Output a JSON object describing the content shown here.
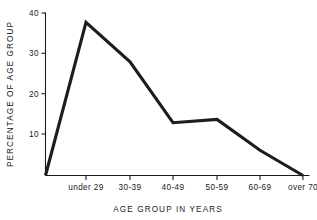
{
  "chart_data": {
    "type": "line",
    "title": "",
    "xlabel": "AGE GROUP IN YEARS",
    "ylabel": "PERCENTAGE OF AGE GROUP",
    "categories": [
      "under 29",
      "30-39",
      "40-49",
      "50-59",
      "60-69",
      "over 70"
    ],
    "values": [
      37.7,
      28.0,
      13.0,
      13.8,
      6.2,
      0.0
    ],
    "series": [
      {
        "name": "Percentage of age group",
        "values": [
          37.7,
          28.0,
          13.0,
          13.8,
          6.2,
          0.0
        ]
      }
    ],
    "leading_origin_point": {
      "note_label": "line rises from baseline left of first category",
      "value": 0.0
    },
    "ylim": [
      0,
      40
    ],
    "yticks": [
      10,
      20,
      30,
      40
    ],
    "ytick_labels": [
      "10",
      "20",
      "30",
      "40"
    ],
    "grid": false,
    "legend": false,
    "legend_position": "none",
    "line_color": "#1d1d1d",
    "axis_color": "#1a1a1a",
    "background_color": "#ffffff"
  },
  "axes": {
    "y_axis_name": "percentage-axis",
    "x_axis_name": "age-group-axis"
  }
}
